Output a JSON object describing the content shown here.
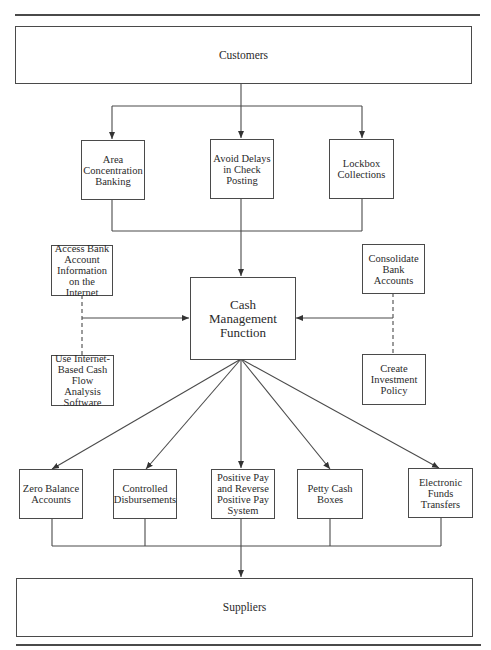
{
  "diagram": {
    "type": "flowchart",
    "top": {
      "label": "Customers"
    },
    "collection_methods": [
      {
        "label": "Area Concentration Banking"
      },
      {
        "label": "Avoid Delays in Check Posting"
      },
      {
        "label": "Lockbox Collections"
      }
    ],
    "center": {
      "label": "Cash Management Function"
    },
    "left_inputs": [
      {
        "label": "Access Bank Account Information on the Internet"
      },
      {
        "label": "Use Internet-Based Cash Flow Analysis Software"
      }
    ],
    "right_inputs": [
      {
        "label": "Consolidate Bank Accounts"
      },
      {
        "label": "Create Investment Policy"
      }
    ],
    "disbursement_methods": [
      {
        "label": "Zero Balance Accounts"
      },
      {
        "label": "Controlled Disbursements"
      },
      {
        "label": "Positive Pay and Reverse Positive Pay System"
      },
      {
        "label": "Petty Cash Boxes"
      },
      {
        "label": "Electronic Funds Transfers"
      }
    ],
    "bottom": {
      "label": "Suppliers"
    },
    "colors": {
      "line": "#4a4a4a",
      "background": "#ffffff"
    }
  }
}
